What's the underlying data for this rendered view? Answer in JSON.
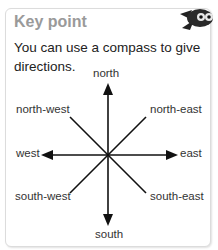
{
  "card": {
    "title": "Key point",
    "text": "You can use a compass to give directions.",
    "mascot_icon": "flying-owl-mascot-icon"
  },
  "compass": {
    "labels": {
      "north": "north",
      "north_east": "north-east",
      "east": "east",
      "south_east": "south-east",
      "south": "south",
      "south_west": "south-west",
      "west": "west",
      "north_west": "north-west"
    }
  },
  "colors": {
    "title": "#9a9a9a",
    "text": "#222222",
    "line": "#111111",
    "border": "#dcdcdc"
  }
}
